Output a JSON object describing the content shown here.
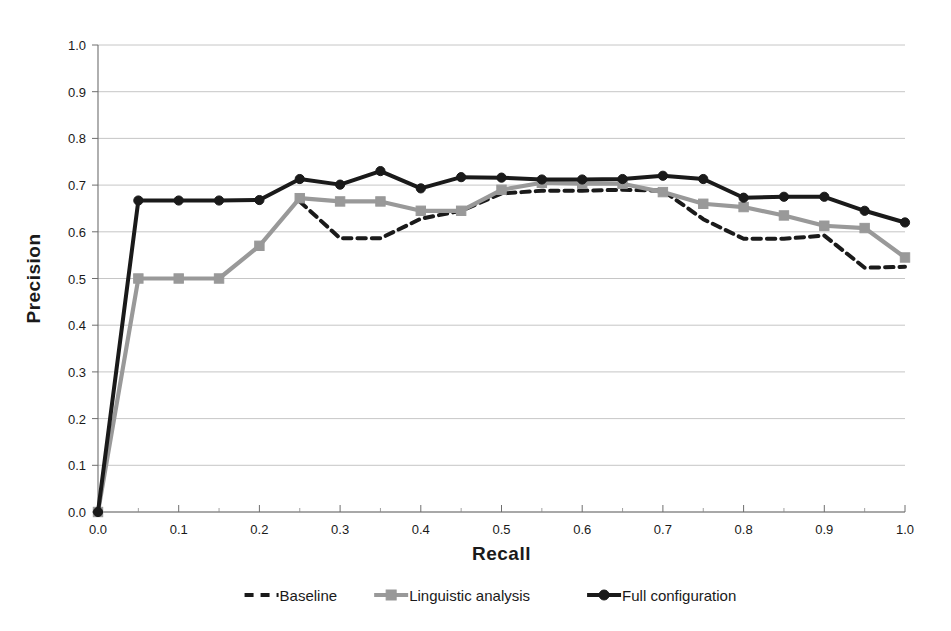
{
  "chart_data": {
    "type": "line",
    "title": "",
    "xlabel": "Recall",
    "ylabel": "Precision",
    "xlim": [
      0.0,
      1.0
    ],
    "ylim": [
      0.0,
      1.0
    ],
    "grid": true,
    "grid_axis": "y",
    "legend_position": "bottom",
    "x_tick_labels": [
      "0.0",
      "0.1",
      "0.2",
      "0.3",
      "0.4",
      "0.5",
      "0.6",
      "0.7",
      "0.8",
      "0.9",
      "1.0"
    ],
    "x_tick_values": [
      0.0,
      0.1,
      0.2,
      0.3,
      0.4,
      0.5,
      0.6,
      0.7,
      0.8,
      0.9,
      1.0
    ],
    "x_minor_tick_values": [
      0.05,
      0.15,
      0.25,
      0.35,
      0.45,
      0.55,
      0.65,
      0.75,
      0.85,
      0.95
    ],
    "y_tick_labels": [
      "0.0",
      "0.1",
      "0.2",
      "0.3",
      "0.4",
      "0.5",
      "0.6",
      "0.7",
      "0.8",
      "0.9",
      "1.0"
    ],
    "y_tick_values": [
      0.0,
      0.1,
      0.2,
      0.3,
      0.4,
      0.5,
      0.6,
      0.7,
      0.8,
      0.9,
      1.0
    ],
    "x": [
      0.0,
      0.05,
      0.1,
      0.15,
      0.2,
      0.25,
      0.3,
      0.35,
      0.4,
      0.45,
      0.5,
      0.55,
      0.6,
      0.65,
      0.7,
      0.75,
      0.8,
      0.85,
      0.9,
      0.95,
      1.0
    ],
    "series": [
      {
        "name": "Baseline",
        "color": "#1a1a1a",
        "style": "dashed",
        "marker": "none",
        "x": [
          0.25,
          0.3,
          0.35,
          0.4,
          0.45,
          0.5,
          0.55,
          0.6,
          0.65,
          0.7,
          0.75,
          0.8,
          0.85,
          0.9,
          0.95,
          1.0
        ],
        "values": [
          0.665,
          0.586,
          0.586,
          0.628,
          0.645,
          0.682,
          0.688,
          0.688,
          0.69,
          0.688,
          0.627,
          0.585,
          0.585,
          0.592,
          0.523,
          0.525
        ]
      },
      {
        "name": "Linguistic analysis",
        "color": "#999999",
        "style": "solid",
        "marker": "square",
        "x": [
          0.0,
          0.05,
          0.1,
          0.15,
          0.2,
          0.25,
          0.3,
          0.35,
          0.4,
          0.45,
          0.5,
          0.55,
          0.6,
          0.65,
          0.7,
          0.75,
          0.8,
          0.85,
          0.9,
          0.95,
          1.0
        ],
        "values": [
          0.0,
          0.5,
          0.5,
          0.5,
          0.57,
          0.672,
          0.665,
          0.665,
          0.645,
          0.645,
          0.69,
          0.705,
          0.703,
          0.703,
          0.685,
          0.66,
          0.653,
          0.635,
          0.613,
          0.608,
          0.545
        ]
      },
      {
        "name": "Full configuration",
        "color": "#1a1a1a",
        "style": "solid",
        "marker": "circle",
        "x": [
          0.0,
          0.05,
          0.1,
          0.15,
          0.2,
          0.25,
          0.3,
          0.35,
          0.4,
          0.45,
          0.5,
          0.55,
          0.6,
          0.65,
          0.7,
          0.75,
          0.8,
          0.85,
          0.9,
          0.95,
          1.0
        ],
        "values": [
          0.0,
          0.667,
          0.667,
          0.667,
          0.668,
          0.713,
          0.701,
          0.73,
          0.693,
          0.717,
          0.716,
          0.712,
          0.712,
          0.713,
          0.72,
          0.713,
          0.673,
          0.675,
          0.675,
          0.645,
          0.62
        ]
      }
    ]
  },
  "legend": {
    "items": [
      {
        "label": "Baseline",
        "color": "#1a1a1a",
        "style": "dashed",
        "marker": "none"
      },
      {
        "label": "Linguistic analysis",
        "color": "#999999",
        "style": "solid",
        "marker": "square"
      },
      {
        "label": "Full configuration",
        "color": "#1a1a1a",
        "style": "solid",
        "marker": "circle"
      }
    ]
  },
  "colors": {
    "baseline": "#1a1a1a",
    "linguistic": "#999999",
    "full": "#1a1a1a",
    "grid": "#b8b8b8",
    "axis": "#6e6e6e",
    "background": "#ffffff"
  }
}
